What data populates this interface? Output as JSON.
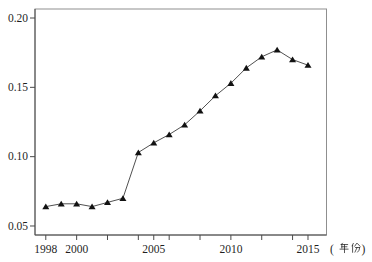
{
  "chart_data": {
    "type": "line",
    "title": "",
    "xlabel": "（年份）",
    "ylabel": "",
    "marker": "filled-triangle-up",
    "grid": false,
    "legend": null,
    "x": [
      1998,
      1999,
      2000,
      2001,
      2002,
      2003,
      2004,
      2005,
      2006,
      2007,
      2008,
      2009,
      2010,
      2011,
      2012,
      2013,
      2014,
      2015
    ],
    "values": [
      0.064,
      0.066,
      0.066,
      0.064,
      0.067,
      0.07,
      0.103,
      0.11,
      0.116,
      0.123,
      0.133,
      0.144,
      0.153,
      0.164,
      0.172,
      0.177,
      0.17,
      0.166
    ],
    "xlim": [
      1997.3,
      2016.2
    ],
    "ylim": [
      0.0435,
      0.2065
    ],
    "x_ticks": [
      1998,
      2000,
      2002,
      2004,
      2005,
      2006,
      2008,
      2010,
      2012,
      2014,
      2015
    ],
    "x_tick_labels": [
      {
        "value": 1998,
        "label": "1998"
      },
      {
        "value": 2000,
        "label": "2000"
      },
      {
        "value": 2005,
        "label": "2005"
      },
      {
        "value": 2010,
        "label": "2010"
      },
      {
        "value": 2015,
        "label": "2015"
      }
    ],
    "y_ticks": [
      {
        "value": 0.05,
        "label": "0.05"
      },
      {
        "value": 0.1,
        "label": "0.10"
      },
      {
        "value": 0.15,
        "label": "0.15"
      },
      {
        "value": 0.2,
        "label": "0.20"
      }
    ]
  },
  "colors": {
    "background": "#ffffff",
    "box": "#8f8f8f",
    "axis": "#4a4a4a",
    "tick": "#4a4a4a",
    "line": "#3c3c3c",
    "marker": "#121212",
    "text": "#1f1f1f"
  }
}
